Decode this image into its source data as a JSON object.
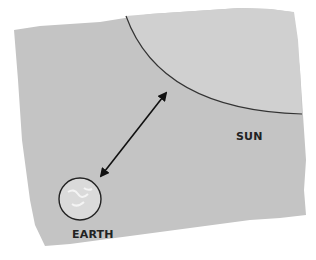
{
  "diagram": {
    "labels": {
      "sun": "SUN",
      "earth": "EARTH"
    },
    "colors": {
      "paper": "#c4c4c4",
      "sun_fill": "#cfcfcf",
      "earth_fill": "#d9d9d9",
      "outline": "#333333",
      "arrow": "#111111",
      "background": "#ffffff"
    },
    "elements": [
      {
        "type": "torn-paper-background"
      },
      {
        "type": "sun-arc",
        "description": "Quarter-circle edge of the Sun in upper right"
      },
      {
        "type": "double-arrow",
        "description": "Distance between Earth and Sun"
      },
      {
        "type": "earth-circle",
        "description": "Small Earth globe in lower left"
      }
    ]
  }
}
